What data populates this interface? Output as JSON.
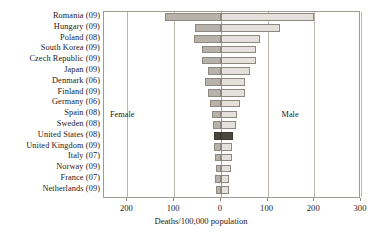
{
  "chart_data": {
    "type": "bar",
    "orientation": "horizontal",
    "style": "diverging-population-pyramid",
    "title": "",
    "xlabel": "Deaths/100,000 population",
    "ylabel": "",
    "categories": [
      "Romania (09)",
      "Hungary (09)",
      "Poland (08)",
      "South Korea (09)",
      "Czech Republic (09)",
      "Japan (09)",
      "Denmark (06)",
      "Finland (09)",
      "Germany (06)",
      "Spain (08)",
      "Sweden (08)",
      "United States (08)",
      "United Kingdom (09)",
      "Italy (07)",
      "Norway (09)",
      "France (07)",
      "Netherlands (09)"
    ],
    "series": [
      {
        "name": "Female",
        "direction": "left",
        "color": "#b7b2ab",
        "values": [
          120,
          56,
          58,
          41,
          40,
          28,
          33,
          28,
          23,
          19,
          16,
          15,
          14,
          13,
          11,
          12,
          10
        ]
      },
      {
        "name": "Male",
        "direction": "right",
        "color": "#e4e1dc",
        "values": [
          200,
          126,
          83,
          76,
          75,
          63,
          51,
          51,
          40,
          35,
          32,
          26,
          24,
          23,
          22,
          18,
          17
        ]
      }
    ],
    "highlight_category": "United States (08)",
    "highlight_color": "#4a4640",
    "axis": {
      "tick_values": [
        -200,
        -100,
        0,
        100,
        200,
        300
      ],
      "tick_labels": [
        "200",
        "100",
        "0",
        "100",
        "200",
        "300"
      ],
      "xlim": [
        -250,
        300
      ],
      "grid": true,
      "grid_axis": "x",
      "legend": "inside-annotations"
    },
    "annotations": [
      {
        "text": "Female",
        "side": "left"
      },
      {
        "text": "Male",
        "side": "right"
      }
    ]
  }
}
